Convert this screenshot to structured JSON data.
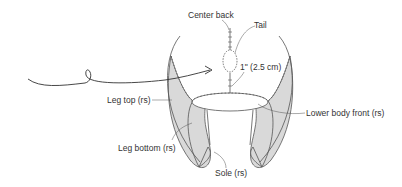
{
  "diagram": {
    "type": "sewing-assembly-illustration",
    "colors": {
      "fill": "#d9d9d9",
      "stroke": "#555555",
      "text": "#333333",
      "background": "#ffffff"
    },
    "labels": {
      "center_back": "Center back",
      "tail": "Tail",
      "measurement": "1\" (2.5 cm)",
      "leg_top": "Leg top (rs)",
      "leg_bottom": "Leg bottom (rs)",
      "lower_body_front": "Lower body front (rs)",
      "sole": "Sole (rs)"
    },
    "elements": [
      {
        "id": "tail-arrow",
        "desc": "Curved arrow with loop pointing to tail"
      },
      {
        "id": "tail-oval",
        "desc": "Small stitched oval tail piece"
      },
      {
        "id": "leg-piece-left",
        "desc": "Left gray leg piece"
      },
      {
        "id": "leg-piece-right",
        "desc": "Right gray leg piece"
      },
      {
        "id": "lower-body-opening",
        "desc": "Oval stitched opening"
      }
    ]
  }
}
